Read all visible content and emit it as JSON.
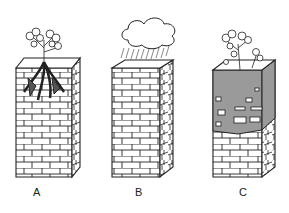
{
  "figure": {
    "panels": [
      {
        "label": "A",
        "description": "Rock column with plant roots breaking into rock"
      },
      {
        "label": "B",
        "description": "Rock column weathered by rain from a cloud"
      },
      {
        "label": "C",
        "description": "Rock column with soil layer and plants on top"
      }
    ],
    "colors": {
      "line": "#222222",
      "soil": "#9a9a9a",
      "background": "#ffffff"
    }
  }
}
